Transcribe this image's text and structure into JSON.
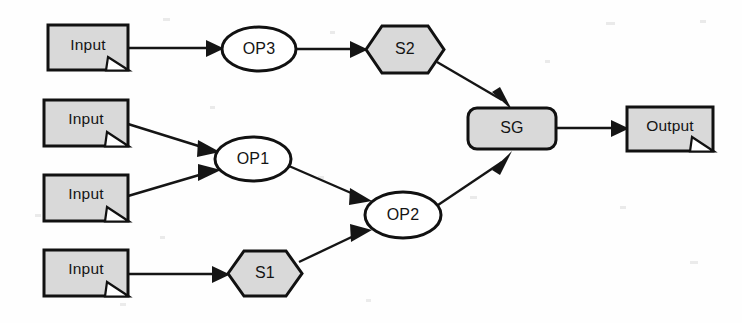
{
  "diagram": {
    "type": "flow-diagram",
    "background_color": "#fefefe",
    "stroke_color": "#111111",
    "fill_gray": "#d9d9d9",
    "fill_white": "#ffffff",
    "nodes": [
      {
        "id": "input1",
        "label": "Input",
        "shape": "document",
        "fill": "#d9d9d9",
        "x": 48,
        "y": 25,
        "w": 80,
        "h": 45
      },
      {
        "id": "input2",
        "label": "Input",
        "shape": "document",
        "fill": "#d9d9d9",
        "x": 44,
        "y": 100,
        "w": 84,
        "h": 46
      },
      {
        "id": "input3",
        "label": "Input",
        "shape": "document",
        "fill": "#d9d9d9",
        "x": 44,
        "y": 175,
        "w": 84,
        "h": 46
      },
      {
        "id": "input4",
        "label": "Input",
        "shape": "document",
        "fill": "#d9d9d9",
        "x": 44,
        "y": 250,
        "w": 84,
        "h": 46
      },
      {
        "id": "op3",
        "label": "OP3",
        "shape": "ellipse",
        "fill": "#ffffff",
        "x": 222,
        "y": 27,
        "w": 74,
        "h": 44
      },
      {
        "id": "op1",
        "label": "OP1",
        "shape": "ellipse",
        "fill": "#ffffff",
        "x": 215,
        "y": 137,
        "w": 76,
        "h": 44
      },
      {
        "id": "op2",
        "label": "OP2",
        "shape": "ellipse",
        "fill": "#ffffff",
        "x": 365,
        "y": 192,
        "w": 76,
        "h": 46
      },
      {
        "id": "s2",
        "label": "S2",
        "shape": "hexagon",
        "fill": "#d9d9d9",
        "x": 366,
        "y": 26,
        "w": 78,
        "h": 47
      },
      {
        "id": "s1",
        "label": "S1",
        "shape": "hexagon",
        "fill": "#d9d9d9",
        "x": 228,
        "y": 251,
        "w": 74,
        "h": 45
      },
      {
        "id": "sg",
        "label": "SG",
        "shape": "rounded-rectangle",
        "fill": "#d9d9d9",
        "x": 468,
        "y": 108,
        "w": 88,
        "h": 41
      },
      {
        "id": "output",
        "label": "Output",
        "shape": "document",
        "fill": "#d9d9d9",
        "x": 627,
        "y": 107,
        "w": 86,
        "h": 44
      }
    ],
    "edges": [
      {
        "from": "input1",
        "to": "op3",
        "arrow": "true"
      },
      {
        "from": "op3",
        "to": "s2",
        "arrow": "true"
      },
      {
        "from": "s2",
        "to": "sg",
        "arrow": "true"
      },
      {
        "from": "input2",
        "to": "op1",
        "arrow": "true"
      },
      {
        "from": "input3",
        "to": "op1",
        "arrow": "true"
      },
      {
        "from": "op1",
        "to": "op2",
        "arrow": "true"
      },
      {
        "from": "input4",
        "to": "s1",
        "arrow": "true"
      },
      {
        "from": "s1",
        "to": "op2",
        "arrow": "true"
      },
      {
        "from": "op2",
        "to": "sg",
        "arrow": "true"
      },
      {
        "from": "sg",
        "to": "output",
        "arrow": "true"
      }
    ]
  }
}
